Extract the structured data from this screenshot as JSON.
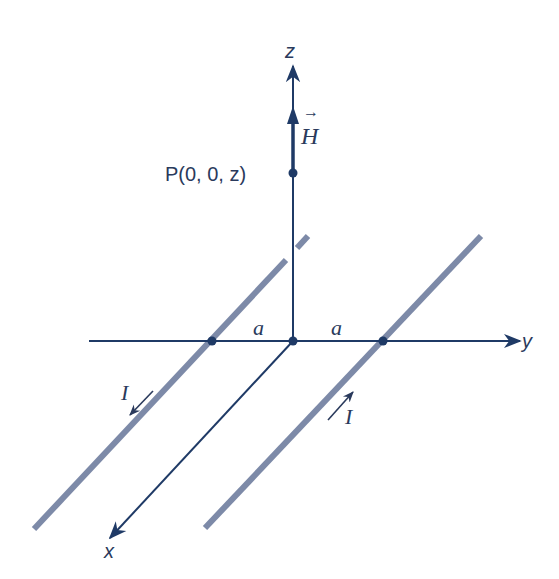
{
  "diagram": {
    "colors": {
      "axis": "#1f3a66",
      "wire": "#7d8aa8",
      "label": "#2a3a5c",
      "background": "#ffffff"
    },
    "axes": {
      "x_label": "x",
      "y_label": "y",
      "z_label": "z"
    },
    "point": {
      "label": "P(0, 0, z)"
    },
    "field_vector": {
      "label": "H",
      "arrow_glyph": "→"
    },
    "distances": {
      "left": "a",
      "right": "a"
    },
    "currents": {
      "left_wire": {
        "label": "I",
        "direction": "toward +x (out toward viewer)"
      },
      "right_wire": {
        "label": "I",
        "direction": "toward -x (away from viewer)"
      }
    }
  }
}
